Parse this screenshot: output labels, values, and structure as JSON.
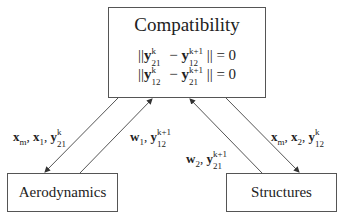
{
  "diagram": {
    "nodes": [
      {
        "id": "compatibility",
        "label": "Compatibility",
        "equations": [
          "||y_21^k − y_12^(k+1)|| = 0",
          "||y_12^k − y_21^(k+1)|| = 0"
        ]
      },
      {
        "id": "aerodynamics",
        "label": "Aerodynamics"
      },
      {
        "id": "structures",
        "label": "Structures"
      }
    ],
    "edges": [
      {
        "from": "compatibility",
        "to": "aerodynamics",
        "label": "x_m, x_1, y_21^k"
      },
      {
        "from": "aerodynamics",
        "to": "compatibility",
        "label": "w_1, y_12^(k+1)"
      },
      {
        "from": "structures",
        "to": "compatibility",
        "label": "w_2, y_21^(k+1)"
      },
      {
        "from": "compatibility",
        "to": "structures",
        "label": "x_m, x_2, y_12^k"
      }
    ]
  },
  "labels": {
    "compat": "Compatibility",
    "aero": "Aerodynamics",
    "struct": "Structures"
  },
  "colors": {
    "line": "#555555",
    "text": "#222222",
    "background": "#ffffff"
  }
}
